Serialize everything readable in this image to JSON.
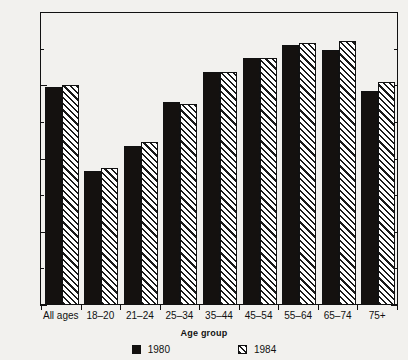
{
  "chart_data": {
    "type": "bar",
    "title": "",
    "xlabel": "Age group",
    "ylabel": "Percentage",
    "ylim": [
      0,
      80
    ],
    "yticks": [
      0,
      20,
      40,
      60,
      80
    ],
    "yticks_minor": [
      10,
      30,
      50,
      70
    ],
    "grid": false,
    "legend_position": "bottom",
    "categories": [
      "All ages",
      "18–20",
      "21–24",
      "25–34",
      "35–44",
      "45–54",
      "55–64",
      "65–74",
      "75+"
    ],
    "series": [
      {
        "name": "1980",
        "color": "#14110f",
        "fill": "solid",
        "values": [
          59.5,
          36.5,
          43.5,
          55.5,
          63.5,
          67.5,
          71.0,
          69.5,
          58.5
        ]
      },
      {
        "name": "1984",
        "color": "#1a1a1a",
        "fill": "diagonal-hatch",
        "values": [
          60.0,
          37.5,
          44.5,
          55.0,
          63.5,
          67.5,
          71.5,
          72.0,
          61.0
        ]
      }
    ]
  },
  "legend": {
    "items": [
      {
        "label": "1980",
        "swatch": "solid-black-square-icon"
      },
      {
        "label": "1984",
        "swatch": "hatched-square-icon"
      }
    ]
  }
}
